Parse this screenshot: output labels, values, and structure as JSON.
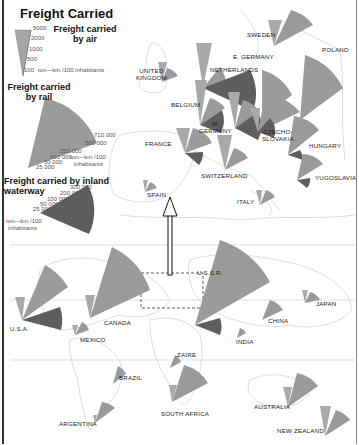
{
  "title": "Freight Carried",
  "legend": {
    "air": {
      "title_line1": "Freight carried",
      "title_line2": "by air",
      "ticks": [
        "5000",
        "2000",
        "1000",
        "500",
        "100"
      ],
      "unit": "ton—km /100 inhabitants",
      "color": "#a9a9a9"
    },
    "rail": {
      "title_line1": "Freight carried",
      "title_line2": "by rail",
      "ticks": [
        "710 000",
        "500 000",
        "250 000",
        "100 000",
        "50 000",
        "25 000"
      ],
      "unit_line1": "ton—km /100",
      "unit_line2": "inhabitants",
      "color": "#9a9a9a"
    },
    "waterway": {
      "title_line1": "Freight carried by inland",
      "title_line2": "waterway",
      "ticks": [
        "300 000",
        "200 000",
        "100 000",
        "50 000",
        "25 000"
      ],
      "unit_line1": "ton—km /100",
      "unit_line2": "inhabitants",
      "color": "#5e5e5e"
    }
  },
  "countries": {
    "sweden": "SWEDEN",
    "e_germany": "E. GERMANY",
    "poland": "POLAND",
    "united_kingdom_1": "UNITED",
    "united_kingdom_2": "KINGDOM",
    "netherlands": "NETHERLANDS",
    "belgium": "BELGIUM",
    "w_germany_1": "W.",
    "w_germany_2": "GERMANY",
    "czechoslovakia_1": "CZECHO-",
    "czechoslovakia_2": "SLOVAKIA",
    "hungary": "HUNGARY",
    "france": "FRANCE",
    "switzerland": "SWITZERLAND",
    "yugoslavia": "YUGOSLAVIA",
    "spain": "SPAIN",
    "italy": "ITALY",
    "ussr": "U.S.S.R.",
    "canada": "CANADA",
    "usa": "U.S.A.",
    "mexico": "MEXICO",
    "japan": "JAPAN",
    "china": "CHINA",
    "india": "INDIA",
    "zaire": "ZAIRE",
    "brazil": "BRAZIL",
    "south_africa": "SOUTH AFRICA",
    "australia": "AUSTRALIA",
    "argentina": "ARGENTINA",
    "new_zealand": "NEW ZEALAND"
  },
  "colors": {
    "air": "#b0b0b0",
    "rail": "#999999",
    "waterway": "#5f5f5f",
    "coast": "#c8c8c8",
    "frame": "#333333"
  }
}
